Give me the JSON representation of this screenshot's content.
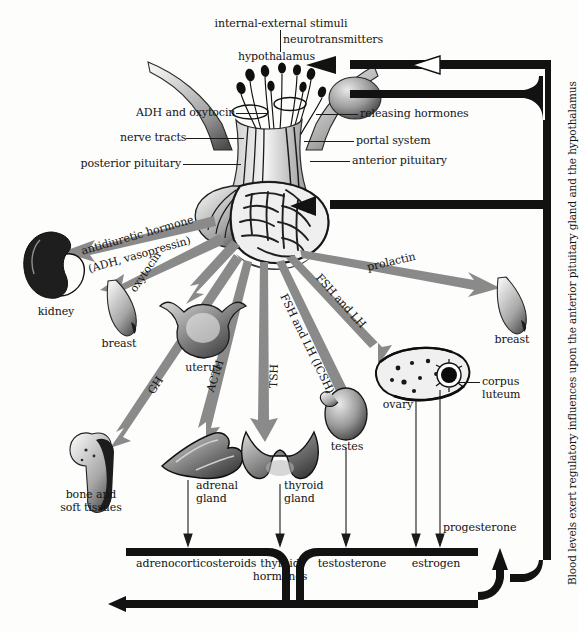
{
  "figure": {
    "type": "anatomical-flow-diagram",
    "background_color": "#fdfdfc",
    "arrow_gray": "#8a8a8a",
    "arrow_black": "#111111"
  },
  "top": {
    "stimuli": "internal-external stimuli",
    "neurotransmitters": "neurotransmitters",
    "hypothalamus": "hypothalamus"
  },
  "pituitary_labels": {
    "adh_oxytocin": "ADH and oxytocin",
    "nerve_tracts": "nerve tracts",
    "posterior_pituitary": "posterior pituitary",
    "releasing_hormones": "releasing hormones",
    "portal_system": "portal system",
    "anterior_pituitary": "anterior pituitary"
  },
  "hormones": {
    "adh_line1": "antidiuretic hormone",
    "adh_line2": "(ADH, vasopressin)",
    "oxytocin": "oxytocin",
    "gh": "GH",
    "acth": "ACTH",
    "tsh": "TSH",
    "fsh_lh_icsh": "FSH and LH (ICSH)",
    "fsh_lh": "FSH and LH",
    "prolactin": "prolactin"
  },
  "targets": [
    {
      "name": "kidney",
      "label": "kidney"
    },
    {
      "name": "breast-left",
      "label": "breast"
    },
    {
      "name": "uterus",
      "label": "uterus"
    },
    {
      "name": "bone",
      "label_line1": "bone and",
      "label_line2": "soft tissues"
    },
    {
      "name": "adrenal-gland",
      "label_line1": "adrenal",
      "label_line2": "gland"
    },
    {
      "name": "thyroid-gland",
      "label_line1": "thyroid",
      "label_line2": "gland"
    },
    {
      "name": "testes",
      "label": "testes"
    },
    {
      "name": "ovary",
      "label": "ovary"
    },
    {
      "name": "corpus-luteum",
      "label_line1": "corpus",
      "label_line2": "luteum"
    },
    {
      "name": "breast-right",
      "label": "breast"
    }
  ],
  "secretions": {
    "adrenocorticosteroids": "adrenocorticosteroids",
    "thyroid_hormones_line1": "thyroid",
    "thyroid_hormones_line2": "hormones",
    "testosterone": "testosterone",
    "estrogen": "estrogen",
    "progesterone": "progesterone"
  },
  "feedback": {
    "caption": "Blood levels exert regulatory influences upon the anterior pituitary gland and the hypothalamus"
  }
}
